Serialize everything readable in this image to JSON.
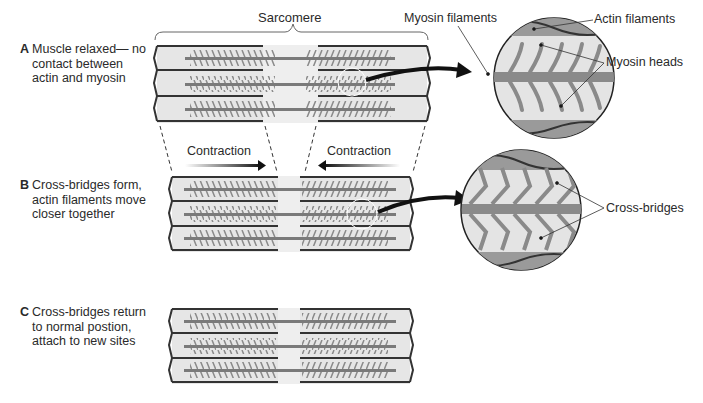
{
  "diagram": {
    "top_label": "Sarcomere",
    "stages": [
      {
        "letter": "A",
        "lines": [
          "Muscle relaxed— no",
          "contact between",
          "actin and myosin"
        ]
      },
      {
        "letter": "B",
        "lines": [
          "Cross-bridges form,",
          "actin filaments move",
          "closer together"
        ]
      },
      {
        "letter": "C",
        "lines": [
          "Cross-bridges return",
          "to normal postion,",
          "attach to new sites"
        ]
      }
    ],
    "arrows": {
      "left": "Contraction",
      "right": "Contraction"
    },
    "callouts": {
      "myosin_filaments": "Myosin filaments",
      "actin_filaments": "Actin filaments",
      "myosin_heads": "Myosin heads",
      "cross_bridges": "Cross-bridges"
    },
    "colors": {
      "background": "#ffffff",
      "sarcomere_fill": "#e6e6e6",
      "filament": "#7a7a7a",
      "outline": "#333333",
      "arrow": "#111111"
    }
  }
}
